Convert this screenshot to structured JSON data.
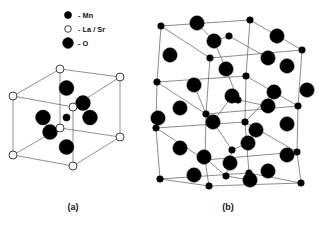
{
  "figure": {
    "width": 322,
    "height": 227,
    "background_color": "#ffffff",
    "title": ""
  },
  "legend": {
    "name": "atom-type-legend",
    "entries": [
      {
        "id": "mn",
        "symbol_shape": "filled-circle",
        "radius": 3.6,
        "color": "#000000",
        "marker_x": 68,
        "marker_y": 15,
        "label": "- Mn",
        "label_x": 78,
        "label_y": 17.6
      },
      {
        "id": "lasr",
        "symbol_shape": "open-circle",
        "radius": 3.3,
        "color": "#ffffff",
        "stroke": "#2a2a2a",
        "marker_x": 68,
        "marker_y": 29,
        "label": "- La / Sr",
        "label_x": 78,
        "label_y": 31.6
      },
      {
        "id": "o",
        "symbol_shape": "filled-circle",
        "radius": 5.4,
        "color": "#000000",
        "marker_x": 68,
        "marker_y": 43,
        "label": "- O",
        "label_x": 78,
        "label_y": 45.6
      }
    ]
  },
  "panels": [
    {
      "id": "a",
      "name": "cubic-perovskite-unit-cell",
      "label": "(a)",
      "label_x": 73,
      "label_y": 210,
      "description": "Ideal cubic perovskite ABO3 unit cell: La/Sr at cube corners, Mn at body centre, O at face centres",
      "cell_type": "cubic",
      "vertices_lasr": [
        {
          "x": 13,
          "y": 96
        },
        {
          "x": 13,
          "y": 155
        },
        {
          "x": 60,
          "y": 69
        },
        {
          "x": 60,
          "y": 128
        },
        {
          "x": 73,
          "y": 107
        },
        {
          "x": 73,
          "y": 166
        },
        {
          "x": 120,
          "y": 77
        },
        {
          "x": 120,
          "y": 137
        }
      ],
      "lasr_radius": 4.0,
      "edges": [
        [
          0,
          1
        ],
        [
          0,
          2
        ],
        [
          0,
          4
        ],
        [
          1,
          3
        ],
        [
          1,
          5
        ],
        [
          2,
          3
        ],
        [
          2,
          6
        ],
        [
          3,
          7
        ],
        [
          4,
          5
        ],
        [
          4,
          6
        ],
        [
          5,
          7
        ],
        [
          6,
          7
        ]
      ],
      "mn_atoms": [
        {
          "x": 66.5,
          "y": 117.5,
          "r": 3.6
        }
      ],
      "o_atoms": [
        {
          "x": 66.5,
          "y": 88,
          "r": 7.4
        },
        {
          "x": 66.5,
          "y": 147,
          "r": 7.4
        },
        {
          "x": 43,
          "y": 117.5,
          "r": 7.4
        },
        {
          "x": 90,
          "y": 117.5,
          "r": 7.4
        },
        {
          "x": 83,
          "y": 103,
          "r": 7.4
        },
        {
          "x": 50,
          "y": 132,
          "r": 7.4
        }
      ]
    },
    {
      "id": "b",
      "name": "orthorhombic-distorted-perovskite-supercell",
      "label": "(b)",
      "label_x": 228,
      "label_y": 210,
      "description": "Orthorhombically distorted (GdFeO3-type) perovskite supercell with tilted MnO6 octahedra",
      "cell_type": "orthorhombic-supercell",
      "bounds": {
        "x0": 152,
        "y0": 18,
        "x1": 312,
        "y1": 188
      },
      "mn_radius": 3.3,
      "o_radius": 7.2,
      "frame_nodes": [
        {
          "x": 161,
          "y": 26
        },
        {
          "x": 250,
          "y": 20
        },
        {
          "x": 302,
          "y": 50
        },
        {
          "x": 210,
          "y": 58
        },
        {
          "x": 157,
          "y": 82
        },
        {
          "x": 246,
          "y": 76
        },
        {
          "x": 298,
          "y": 106
        },
        {
          "x": 206,
          "y": 114
        },
        {
          "x": 156,
          "y": 128
        },
        {
          "x": 245,
          "y": 122
        },
        {
          "x": 297,
          "y": 152
        },
        {
          "x": 205,
          "y": 160
        },
        {
          "x": 160,
          "y": 179
        },
        {
          "x": 249,
          "y": 173
        },
        {
          "x": 301,
          "y": 183
        },
        {
          "x": 209,
          "y": 186
        }
      ],
      "frame_edges": [
        [
          0,
          1
        ],
        [
          1,
          2
        ],
        [
          2,
          3
        ],
        [
          3,
          0
        ],
        [
          4,
          5
        ],
        [
          5,
          6
        ],
        [
          6,
          7
        ],
        [
          7,
          4
        ],
        [
          8,
          9
        ],
        [
          9,
          10
        ],
        [
          10,
          11
        ],
        [
          11,
          8
        ],
        [
          12,
          13
        ],
        [
          13,
          14
        ],
        [
          14,
          15
        ],
        [
          15,
          12
        ],
        [
          0,
          4
        ],
        [
          1,
          5
        ],
        [
          2,
          6
        ],
        [
          3,
          7
        ],
        [
          4,
          8
        ],
        [
          5,
          9
        ],
        [
          6,
          10
        ],
        [
          7,
          11
        ],
        [
          8,
          12
        ],
        [
          9,
          13
        ],
        [
          10,
          14
        ],
        [
          11,
          15
        ]
      ],
      "mn_atoms": [
        {
          "x": 161,
          "y": 26
        },
        {
          "x": 250,
          "y": 20
        },
        {
          "x": 302,
          "y": 50
        },
        {
          "x": 210,
          "y": 58
        },
        {
          "x": 157,
          "y": 82
        },
        {
          "x": 246,
          "y": 76
        },
        {
          "x": 298,
          "y": 106
        },
        {
          "x": 206,
          "y": 114
        },
        {
          "x": 156,
          "y": 128
        },
        {
          "x": 245,
          "y": 122
        },
        {
          "x": 297,
          "y": 152
        },
        {
          "x": 205,
          "y": 160
        },
        {
          "x": 160,
          "y": 179
        },
        {
          "x": 249,
          "y": 173
        },
        {
          "x": 301,
          "y": 183
        },
        {
          "x": 209,
          "y": 186
        },
        {
          "x": 229,
          "y": 36
        },
        {
          "x": 238,
          "y": 100
        },
        {
          "x": 232,
          "y": 150
        },
        {
          "x": 226,
          "y": 176
        }
      ],
      "o_atoms": [
        {
          "x": 197,
          "y": 23
        },
        {
          "x": 277,
          "y": 36
        },
        {
          "x": 214,
          "y": 41
        },
        {
          "x": 268,
          "y": 58
        },
        {
          "x": 170,
          "y": 55
        },
        {
          "x": 287,
          "y": 66
        },
        {
          "x": 226,
          "y": 69
        },
        {
          "x": 194,
          "y": 85
        },
        {
          "x": 232,
          "y": 96
        },
        {
          "x": 274,
          "y": 92
        },
        {
          "x": 307,
          "y": 90
        },
        {
          "x": 180,
          "y": 108
        },
        {
          "x": 268,
          "y": 106
        },
        {
          "x": 158,
          "y": 118
        },
        {
          "x": 213,
          "y": 122
        },
        {
          "x": 256,
          "y": 130
        },
        {
          "x": 287,
          "y": 124
        },
        {
          "x": 248,
          "y": 143
        },
        {
          "x": 180,
          "y": 148
        },
        {
          "x": 287,
          "y": 155
        },
        {
          "x": 204,
          "y": 157
        },
        {
          "x": 230,
          "y": 163
        },
        {
          "x": 194,
          "y": 175
        },
        {
          "x": 268,
          "y": 171
        },
        {
          "x": 250,
          "y": 180
        }
      ],
      "tilt_bonds": [
        [
          229,
          36,
          214,
          41
        ],
        [
          214,
          41,
          197,
          23
        ],
        [
          229,
          36,
          268,
          58
        ],
        [
          226,
          69,
          214,
          41
        ],
        [
          226,
          69,
          238,
          100
        ],
        [
          238,
          100,
          232,
          96
        ],
        [
          232,
          96,
          213,
          122
        ],
        [
          238,
          100,
          268,
          106
        ],
        [
          213,
          122,
          232,
          150
        ],
        [
          232,
          150,
          248,
          143
        ],
        [
          232,
          150,
          226,
          176
        ],
        [
          226,
          176,
          204,
          157
        ],
        [
          226,
          176,
          250,
          180
        ],
        [
          194,
          85,
          206,
          114
        ],
        [
          274,
          92,
          245,
          122
        ]
      ]
    }
  ]
}
